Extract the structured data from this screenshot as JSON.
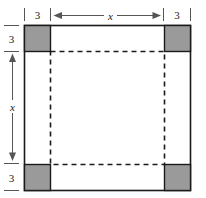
{
  "figure": {
    "colors": {
      "corner_fill": "#9a9a9a",
      "corner_stroke": "#1a1a1a",
      "outline": "#1a1a1a",
      "dashed": "#1a1a1a",
      "dimension": "#555555",
      "background": "#ffffff"
    },
    "labels": {
      "top_left_margin": "3",
      "top_right_margin": "3",
      "top_span": "x",
      "left_top_margin": "3",
      "left_bottom_margin": "3",
      "left_span": "x"
    },
    "geometry": {
      "outer_square": {
        "left": 24,
        "top": 25,
        "right": 190,
        "bottom": 190
      },
      "corner_size": 26,
      "corner_squares": [
        {
          "name": "top-left",
          "x": 24,
          "y": 25
        },
        {
          "name": "top-right",
          "x": 164,
          "y": 25
        },
        {
          "name": "bottom-left",
          "x": 24,
          "y": 164
        },
        {
          "name": "bottom-right",
          "x": 164,
          "y": 164
        }
      ],
      "dashed_square": {
        "left": 50,
        "top": 51,
        "right": 164,
        "bottom": 164
      }
    }
  }
}
